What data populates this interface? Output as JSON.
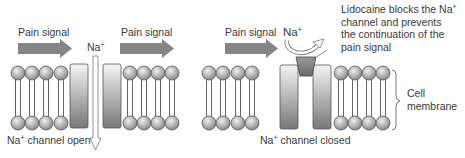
{
  "left_panel": {
    "signal_label_1": "Pain signal",
    "signal_label_2": "Pain signal",
    "ion_label": "Na",
    "ion_charge": "+",
    "caption_ion": "Na",
    "caption_charge": "+",
    "caption_text": " channel open"
  },
  "right_panel": {
    "signal_label": "Pain signal",
    "ion_label": "Na",
    "ion_charge": "+",
    "annotation_line1": "Lidocaine blocks the Na",
    "annotation_line1_charge": "+",
    "annotation_line2": "channel and prevents",
    "annotation_line3": "the continuation of the",
    "annotation_line4": "pain signal",
    "caption_ion": "Na",
    "caption_charge": "+",
    "caption_text": " channel closed",
    "membrane_label_line1": "Cell",
    "membrane_label_line2": "membrane"
  },
  "colors": {
    "signal_arrow": "#858585",
    "head_fill_light": "#e6e6e6",
    "head_fill_dark": "#8c8c8c",
    "channel_light": "#f2f2f2",
    "channel_dark": "#7a7a7a",
    "lidocaine_plug": "#7d7d7d",
    "outline": "#555555"
  }
}
